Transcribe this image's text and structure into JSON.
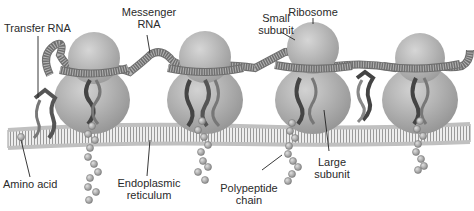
{
  "diagram": {
    "labels": {
      "transfer_rna": "Transfer RNA",
      "messenger_rna_1": "Messenger",
      "messenger_rna_2": "RNA",
      "small_subunit_1": "Small",
      "small_subunit_2": "subunit",
      "ribosome": "Ribosome",
      "amino_acid": "Amino acid",
      "er_1": "Endoplasmic",
      "er_2": "reticulum",
      "polypeptide_1": "Polypeptide",
      "polypeptide_2": "chain",
      "large_subunit_1": "Large",
      "large_subunit_2": "subunit"
    },
    "ribosome_count": 4,
    "colors": {
      "ribosome": "#a9a9a9",
      "ribosome_highlight": "#d4d4d4",
      "membrane": "#bdbdbd",
      "mrna": "#8c8c8c",
      "trna": "#555555",
      "amino_acid": "#9e9e9e",
      "leader_line": "#222222"
    }
  }
}
